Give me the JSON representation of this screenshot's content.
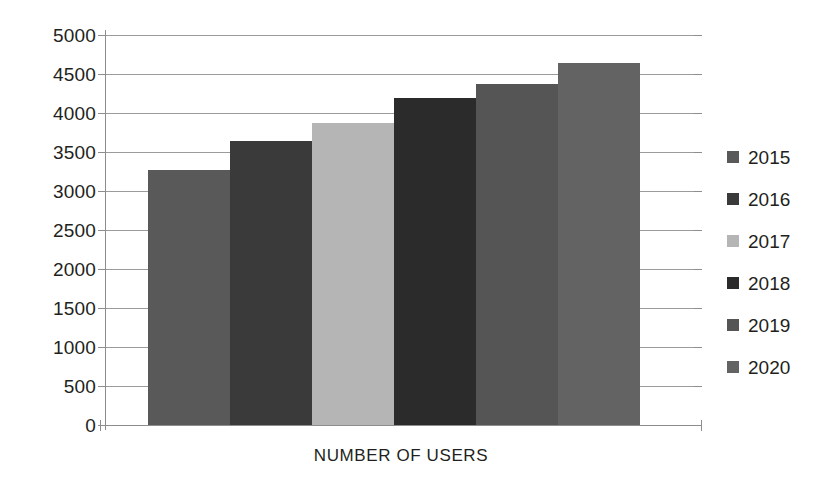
{
  "chart_data": {
    "type": "bar",
    "title": "",
    "xlabel": "NUMBER OF USERS",
    "ylabel": "",
    "categories": [
      "2015",
      "2016",
      "2017",
      "2018",
      "2019",
      "2020"
    ],
    "values": [
      3270,
      3640,
      3870,
      4190,
      4370,
      4640
    ],
    "series": [
      {
        "name": "Number of users",
        "values": [
          3270,
          3640,
          3870,
          4190,
          4370,
          4640
        ]
      }
    ],
    "ylim": [
      0,
      5000
    ],
    "y_ticks": [
      0,
      500,
      1000,
      1500,
      2000,
      2500,
      3000,
      3500,
      4000,
      4500,
      5000
    ],
    "y_tick_labels": [
      "0",
      "500",
      "1000",
      "1500",
      "2000",
      "2500",
      "3000",
      "3500",
      "4000",
      "4500",
      "5000"
    ],
    "grid": true,
    "grid_axis": "y",
    "legend_position": "right",
    "bar_colors": [
      "#595959",
      "#3a3a3a",
      "#b5b5b5",
      "#2b2b2b",
      "#555555",
      "#636363"
    ],
    "background_color": "#ffffff",
    "text_color": "#231f20",
    "grid_color": "#9b9b9b"
  },
  "legend": {
    "entries": [
      {
        "label": "2015",
        "color": "#595959"
      },
      {
        "label": "2016",
        "color": "#3a3a3a"
      },
      {
        "label": "2017",
        "color": "#b5b5b5"
      },
      {
        "label": "2018",
        "color": "#2b2b2b"
      },
      {
        "label": "2019",
        "color": "#555555"
      },
      {
        "label": "2020",
        "color": "#636363"
      }
    ]
  },
  "axes": {
    "x_title": "NUMBER OF USERS"
  }
}
